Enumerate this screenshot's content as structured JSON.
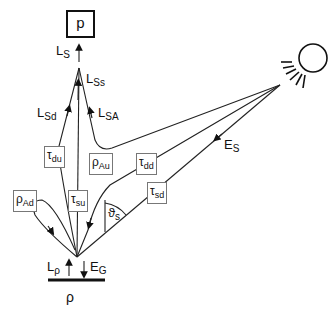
{
  "diagram": {
    "sensor_box": {
      "label": "p"
    },
    "sun": {
      "icon": "sun-icon"
    },
    "surface": {
      "symbol": "ρ"
    },
    "labels": {
      "L_S": {
        "main": "L",
        "sub": "S"
      },
      "L_Ss": {
        "main": "L",
        "sub": "Ss"
      },
      "L_Sd": {
        "main": "L",
        "sub": "Sd"
      },
      "L_SA": {
        "main": "L",
        "sub": "SA"
      },
      "E_S": {
        "main": "E",
        "sub": "S"
      },
      "L_rho": {
        "main": "L",
        "sub": "ρ"
      },
      "E_G": {
        "main": "E",
        "sub": "G"
      },
      "theta_s": {
        "main": "ϑ",
        "sub": "s"
      }
    },
    "boxes": {
      "tau_du": {
        "main": "τ",
        "sub": "du"
      },
      "tau_su": {
        "main": "τ",
        "sub": "su"
      },
      "rho_Au": {
        "main": "ρ",
        "sub": "Au"
      },
      "tau_dd": {
        "main": "τ",
        "sub": "dd"
      },
      "tau_sd": {
        "main": "τ",
        "sub": "sd"
      },
      "rho_Ad": {
        "main": "ρ",
        "sub": "Ad"
      }
    },
    "colors": {
      "line": "#222222",
      "box_border": "#777777",
      "background": "#ffffff"
    }
  }
}
